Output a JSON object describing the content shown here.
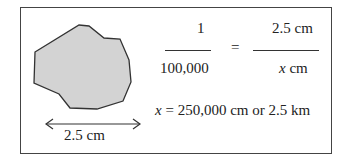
{
  "diagram": {
    "shape": {
      "fill": "#d3d3d3",
      "stroke": "#333333",
      "points": "35,52 79,25 89,26 104,38 120,39 129,60 131,82 123,101 97,109 70,108 59,94 34,83"
    },
    "scale_label": "2.5 cm",
    "equation": {
      "left_numerator": "1",
      "left_denominator": "100,000",
      "equals": "=",
      "right_numerator": "2.5 cm",
      "right_denominator_var": "x",
      "right_denominator_unit": " cm"
    },
    "result": {
      "var": "x",
      "text": " = 250,000 cm or 2.5 km"
    }
  }
}
